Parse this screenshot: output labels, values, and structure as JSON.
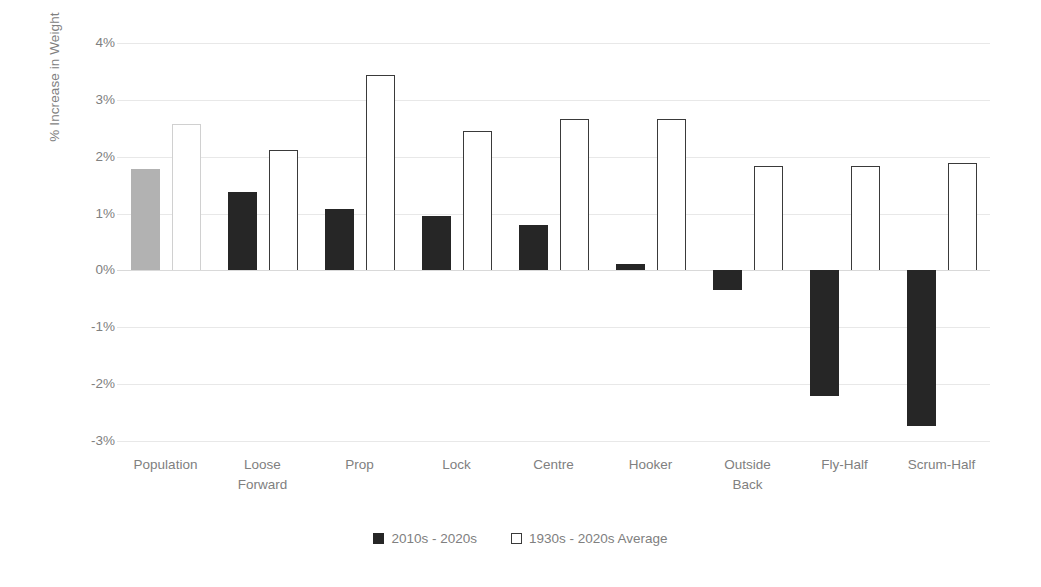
{
  "chart_data": {
    "type": "bar",
    "title": "",
    "xlabel": "",
    "ylabel": "% Increase in Weight",
    "ylim": [
      -3,
      4
    ],
    "ytick_step": 1,
    "ytick_labels": [
      "4%",
      "3%",
      "2%",
      "1%",
      "0%",
      "-1%",
      "-2%",
      "-3%"
    ],
    "ytick_values": [
      4,
      3,
      2,
      1,
      0,
      -1,
      -2,
      -3
    ],
    "grid": true,
    "grid_axis": "y",
    "legend_position": "bottom",
    "categories": [
      "Population",
      "Loose\nForward",
      "Prop",
      "Lock",
      "Centre",
      "Hooker",
      "Outside\nBack",
      "Fly-Half",
      "Scrum-Half"
    ],
    "series": [
      {
        "name": "2010s - 2020s",
        "color": "#262626",
        "style": "filled",
        "values": [
          1.78,
          1.38,
          1.08,
          0.96,
          0.8,
          0.12,
          -0.34,
          -2.21,
          -2.74
        ]
      },
      {
        "name": "1930s - 2020s Average",
        "color": "#ffffff",
        "edgecolor": "#3a3a3a",
        "style": "outline",
        "values": [
          2.58,
          2.11,
          3.43,
          2.45,
          2.66,
          2.66,
          1.83,
          1.83,
          1.89
        ]
      }
    ],
    "series_overrides": [
      {
        "category": "Population",
        "series": "2010s - 2020s",
        "color": "#b2b2b2",
        "note": "population bar rendered light gray"
      },
      {
        "category": "Population",
        "series": "1930s - 2020s Average",
        "edgecolor": "#d0d0d0",
        "note": "population outline bar rendered light gray"
      }
    ]
  },
  "legend": {
    "items": [
      {
        "label": "2010s - 2020s",
        "style": "filled"
      },
      {
        "label": "1930s - 2020s Average",
        "style": "outline"
      }
    ]
  },
  "colors": {
    "axis_text": "#808080",
    "gridline": "#e8e8e8",
    "zero_line": "#d9d9d9",
    "bar_dark": "#262626",
    "bar_gray": "#b2b2b2",
    "background": "#ffffff"
  }
}
